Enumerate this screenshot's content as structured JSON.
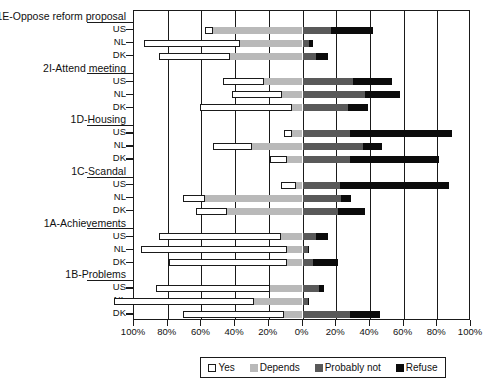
{
  "chart_data": {
    "type": "bar",
    "subtype": "diverging-stacked-bar",
    "title": "",
    "xlabel": "",
    "ylabel": "",
    "orientation": "horizontal",
    "grid": true,
    "legend_position": "bottom",
    "xlim": [
      -100,
      100
    ],
    "xticks": [
      -100,
      -80,
      -60,
      -40,
      -20,
      0,
      20,
      40,
      60,
      80,
      100
    ],
    "xticklabels": [
      "100%",
      "80%",
      "60%",
      "40%",
      "20%",
      "0%",
      "20%",
      "40%",
      "60%",
      "80%",
      "100%"
    ],
    "axis_note": "Left side counts outward from 0% at centre; both wings labelled 0-100%",
    "categories": [
      "Yes",
      "Depends",
      "Probably not",
      "Refuse"
    ],
    "category_colors": [
      "#ffffff",
      "#b9b9b9",
      "#595959",
      "#0b0b0b"
    ],
    "groups": [
      {
        "label": "1E-Oppose reform proposal",
        "rows": [
          {
            "country": "US",
            "values": {
              "Yes": 5,
              "Depends": 53,
              "Probably not": 17,
              "Refuse": 25
            }
          },
          {
            "country": "NL",
            "values": {
              "Yes": 57,
              "Depends": 37,
              "Probably not": 4,
              "Refuse": 2
            }
          },
          {
            "country": "DK",
            "values": {
              "Yes": 42,
              "Depends": 43,
              "Probably not": 8,
              "Refuse": 7
            }
          }
        ]
      },
      {
        "label": "2I-Attend meeting",
        "rows": [
          {
            "country": "US",
            "values": {
              "Yes": 24,
              "Depends": 23,
              "Probably not": 30,
              "Refuse": 23
            }
          },
          {
            "country": "NL",
            "values": {
              "Yes": 30,
              "Depends": 12,
              "Probably not": 37,
              "Refuse": 21
            }
          },
          {
            "country": "DK",
            "values": {
              "Yes": 55,
              "Depends": 6,
              "Probably not": 27,
              "Refuse": 12
            }
          }
        ]
      },
      {
        "label": "1D-Housing",
        "rows": [
          {
            "country": "US",
            "values": {
              "Yes": 5,
              "Depends": 6,
              "Probably not": 28,
              "Refuse": 61
            }
          },
          {
            "country": "NL",
            "values": {
              "Yes": 23,
              "Depends": 30,
              "Probably not": 36,
              "Refuse": 11
            }
          },
          {
            "country": "DK",
            "values": {
              "Yes": 10,
              "Depends": 9,
              "Probably not": 28,
              "Refuse": 53
            }
          }
        ]
      },
      {
        "label": "1C-Scandal",
        "rows": [
          {
            "country": "US",
            "values": {
              "Yes": 9,
              "Depends": 4,
              "Probably not": 22,
              "Refuse": 65
            }
          },
          {
            "country": "NL",
            "values": {
              "Yes": 13,
              "Depends": 58,
              "Probably not": 23,
              "Refuse": 6
            }
          },
          {
            "country": "DK",
            "values": {
              "Yes": 18,
              "Depends": 45,
              "Probably not": 21,
              "Refuse": 16
            }
          }
        ]
      },
      {
        "label": "1A-Achievements",
        "rows": [
          {
            "country": "US",
            "values": {
              "Yes": 72,
              "Depends": 13,
              "Probably not": 8,
              "Refuse": 7
            }
          },
          {
            "country": "NL",
            "values": {
              "Yes": 87,
              "Depends": 9,
              "Probably not": 3,
              "Refuse": 1
            }
          },
          {
            "country": "DK",
            "values": {
              "Yes": 70,
              "Depends": 9,
              "Probably not": 6,
              "Refuse": 15
            }
          }
        ]
      },
      {
        "label": "1B-Problems",
        "rows": [
          {
            "country": "US",
            "values": {
              "Yes": 68,
              "Depends": 19,
              "Probably not": 10,
              "Refuse": 3
            }
          },
          {
            "country": "NL",
            "values": {
              "Yes": 83,
              "Depends": 29,
              "Probably not": 3,
              "Refuse": 1
            }
          },
          {
            "country": "DK",
            "values": {
              "Yes": 60,
              "Depends": 11,
              "Probably not": 28,
              "Refuse": 18
            }
          }
        ]
      }
    ],
    "legend": [
      {
        "label": "Yes",
        "color": "#ffffff",
        "swatch": "sw-yes"
      },
      {
        "label": "Depends",
        "color": "#b9b9b9",
        "swatch": "sw-depends"
      },
      {
        "label": "Probably not",
        "color": "#595959",
        "swatch": "sw-probnot"
      },
      {
        "label": "Refuse",
        "color": "#0b0b0b",
        "swatch": "sw-refuse"
      }
    ]
  }
}
